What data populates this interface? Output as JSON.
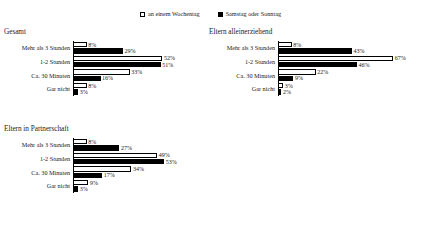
{
  "legend": {
    "entries": [
      {
        "label": "an einem Wochentag",
        "marker": "open-square",
        "color": "#ffffff"
      },
      {
        "label": "Samstag oder Sonntag",
        "marker": "filled-square",
        "color": "#000000"
      }
    ]
  },
  "chart_data": {
    "type": "bar",
    "orientation": "horizontal",
    "title": "",
    "xlabel": "",
    "ylabel": "",
    "xlim": [
      0,
      70
    ],
    "grid": false,
    "legend_position": "top-center",
    "categories": [
      "Mehr als 3 Stunden",
      "1-2 Stunden",
      "Ca. 30 Minuten",
      "Gar nicht"
    ],
    "series_names": [
      "an einem Wochentag",
      "Samstag oder Sonntag"
    ],
    "panels": [
      {
        "title": "Gesamt",
        "series": [
          {
            "name": "an einem Wochentag",
            "values": [
              8,
              52,
              33,
              8
            ],
            "labels": [
              "8%",
              "52%",
              "33%",
              "8%"
            ]
          },
          {
            "name": "Samstag oder Sonntag",
            "values": [
              29,
              51,
              16,
              3
            ],
            "labels": [
              "29%",
              "51%",
              "16%",
              "3%"
            ]
          }
        ]
      },
      {
        "title": "Eltern alleinerziehend",
        "series": [
          {
            "name": "an einem Wochentag",
            "values": [
              8,
              67,
              22,
              3
            ],
            "labels": [
              "8%",
              "67%",
              "22%",
              "3%"
            ]
          },
          {
            "name": "Samstag oder Sonntag",
            "values": [
              43,
              46,
              9,
              2
            ],
            "labels": [
              "43%",
              "46%",
              "9%",
              "2%"
            ]
          }
        ]
      },
      {
        "title": "Eltern in Partnerschaft",
        "series": [
          {
            "name": "an einem Wochentag",
            "values": [
              8,
              49,
              34,
              9
            ],
            "labels": [
              "8%",
              "49%",
              "34%",
              "9%"
            ]
          },
          {
            "name": "Samstag oder Sonntag",
            "values": [
              27,
              53,
              17,
              3
            ],
            "labels": [
              "27%",
              "53%",
              "17%",
              "3%"
            ]
          }
        ]
      }
    ]
  }
}
